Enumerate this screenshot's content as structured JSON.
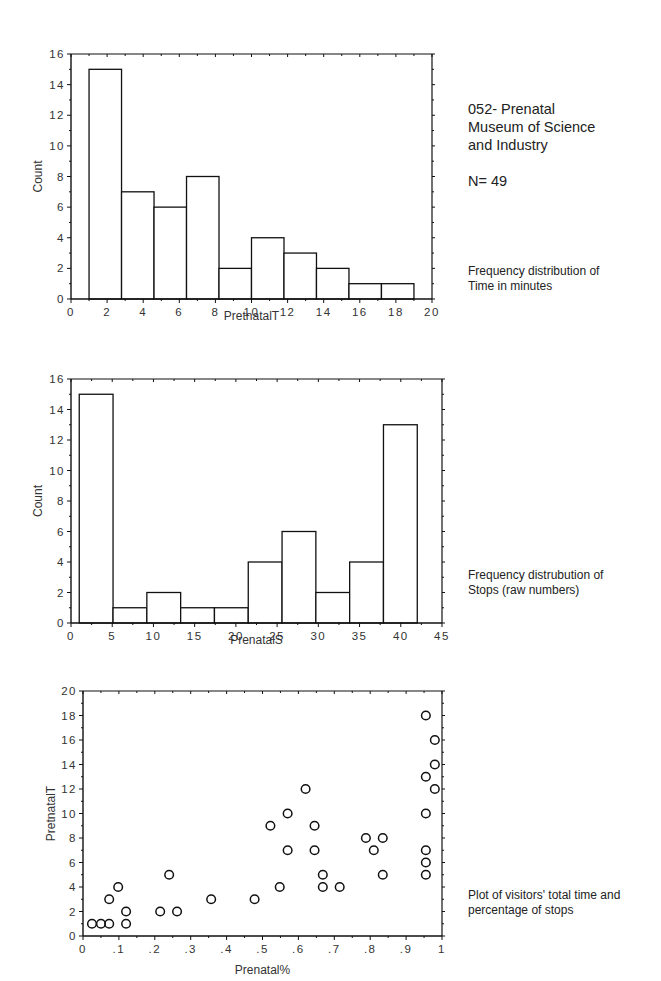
{
  "header": {
    "title_lines": [
      "052- Prenatal",
      "Museum of Science",
      "and Industry"
    ],
    "n_label": "N= 49"
  },
  "captions": {
    "chart1": [
      "Frequency distribution of",
      "Time in minutes"
    ],
    "chart2": [
      "Frequency distrubution of",
      "Stops (raw numbers)"
    ],
    "chart3": [
      "Plot of visitors' total time and",
      "percentage of stops"
    ]
  },
  "chart_data": [
    {
      "type": "bar",
      "subtype": "histogram",
      "title": "Frequency distribution of Time in minutes",
      "xlabel": "PretnatalT",
      "ylabel": "Count",
      "xlim": [
        0,
        20
      ],
      "ylim": [
        0,
        16
      ],
      "xticks": [
        0,
        2,
        4,
        6,
        8,
        10,
        12,
        14,
        16,
        18,
        20
      ],
      "yticks": [
        0,
        2,
        4,
        6,
        8,
        10,
        12,
        14,
        16
      ],
      "bin_edges": [
        1,
        2.8,
        4.6,
        6.4,
        8.2,
        10,
        11.8,
        13.6,
        15.4,
        17.2,
        19
      ],
      "values": [
        15,
        7,
        6,
        8,
        2,
        4,
        3,
        2,
        1,
        1
      ],
      "grid": false
    },
    {
      "type": "bar",
      "subtype": "histogram",
      "title": "Frequency distrubution of Stops (raw numbers)",
      "xlabel": "PrenatalS",
      "ylabel": "Count",
      "xlim": [
        0,
        45
      ],
      "ylim": [
        0,
        16
      ],
      "xticks": [
        0,
        5,
        10,
        15,
        20,
        25,
        30,
        35,
        40,
        45
      ],
      "yticks": [
        0,
        2,
        4,
        6,
        8,
        10,
        12,
        14,
        16
      ],
      "bin_edges": [
        1,
        5.1,
        9.2,
        13.3,
        17.4,
        21.5,
        25.6,
        29.7,
        33.8,
        37.9,
        42
      ],
      "values": [
        15,
        1,
        2,
        1,
        1,
        4,
        6,
        2,
        4,
        13
      ],
      "grid": false
    },
    {
      "type": "scatter",
      "title": "Plot of visitors' total time and percentage of stops",
      "xlabel": "Prenatal%",
      "ylabel": "PretnatalT",
      "xlim": [
        0,
        1
      ],
      "ylim": [
        0,
        20
      ],
      "xticks": [
        "0",
        ".1",
        ".2",
        ".3",
        ".4",
        ".5",
        ".6",
        ".7",
        ".8",
        ".9",
        "1"
      ],
      "yticks": [
        0,
        2,
        4,
        6,
        8,
        10,
        12,
        14,
        16,
        18,
        20
      ],
      "points": [
        [
          0.025,
          1
        ],
        [
          0.05,
          1
        ],
        [
          0.073,
          1
        ],
        [
          0.12,
          1
        ],
        [
          0.12,
          2
        ],
        [
          0.215,
          2
        ],
        [
          0.262,
          2
        ],
        [
          0.073,
          3
        ],
        [
          0.357,
          3
        ],
        [
          0.478,
          3
        ],
        [
          0.098,
          4
        ],
        [
          0.548,
          4
        ],
        [
          0.668,
          4
        ],
        [
          0.715,
          4
        ],
        [
          0.24,
          5
        ],
        [
          0.668,
          5
        ],
        [
          0.835,
          5
        ],
        [
          0.955,
          5
        ],
        [
          0.955,
          6
        ],
        [
          0.57,
          7
        ],
        [
          0.645,
          7
        ],
        [
          0.81,
          7
        ],
        [
          0.955,
          7
        ],
        [
          0.788,
          8
        ],
        [
          0.835,
          8
        ],
        [
          0.522,
          9
        ],
        [
          0.645,
          9
        ],
        [
          0.57,
          10
        ],
        [
          0.955,
          10
        ],
        [
          0.62,
          12
        ],
        [
          0.98,
          12
        ],
        [
          0.955,
          13
        ],
        [
          0.98,
          14
        ],
        [
          0.98,
          16
        ],
        [
          0.955,
          18
        ]
      ],
      "marker": "open-circle",
      "grid": false
    }
  ]
}
